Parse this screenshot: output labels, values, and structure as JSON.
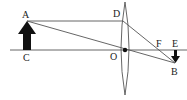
{
  "diagram": {
    "type": "convex-lens-ray-diagram",
    "labels": {
      "A": "A",
      "B": "B",
      "C": "C",
      "D": "D",
      "E": "E",
      "F": "F",
      "O": "O"
    },
    "colors": {
      "line": "#555555",
      "arrow": "#111111",
      "background": "#ffffff"
    },
    "points": {
      "A": [
        27,
        21
      ],
      "C": [
        27,
        50
      ],
      "D": [
        123,
        21
      ],
      "O": [
        125,
        50
      ],
      "F": [
        160,
        50
      ],
      "E": [
        175,
        50
      ],
      "B": [
        175,
        63
      ]
    }
  }
}
